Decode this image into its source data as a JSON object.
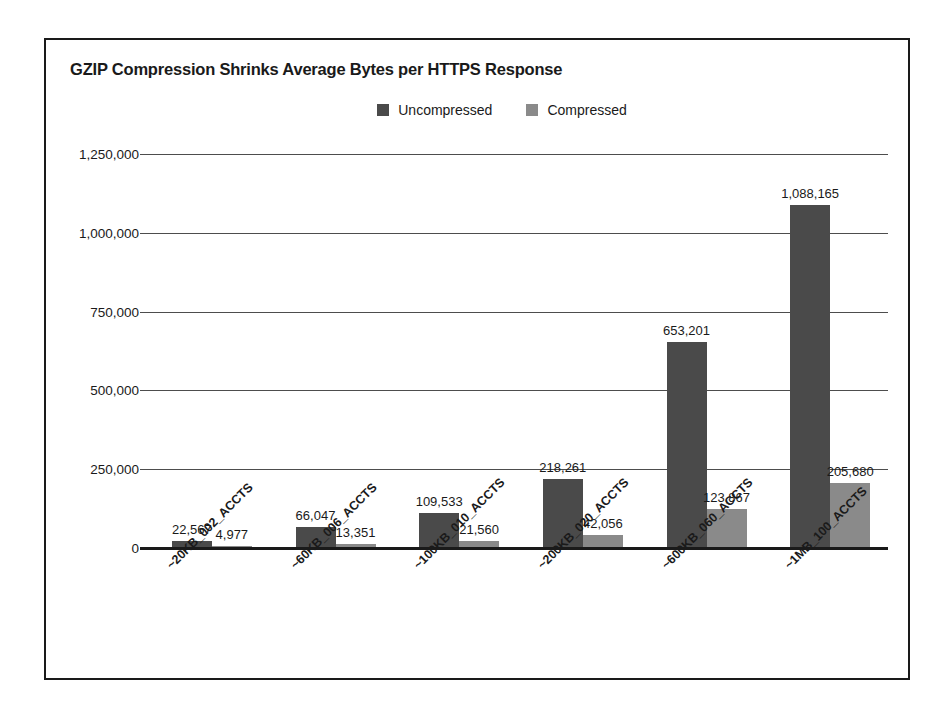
{
  "chart_data": {
    "type": "bar",
    "title": "GZIP Compression Shrinks Average Bytes per HTTPS Response",
    "xlabel": "",
    "ylabel": "",
    "ylim": [
      0,
      1250000
    ],
    "grid": true,
    "legend_position": "top-center",
    "categories": [
      "~20KB_002_ACCTS",
      "~60KB_006_ACCTS",
      "~100KB_010_ACCTS",
      "~200KB_020_ACCTS",
      "~600KB_060_ACCTS",
      "~1MB_100_ACCTS"
    ],
    "ytick_labels": [
      "0",
      "250,000",
      "500,000",
      "750,000",
      "1,000,000",
      "1,250,000"
    ],
    "ytick_values": [
      0,
      250000,
      500000,
      750000,
      1000000,
      1250000
    ],
    "series": [
      {
        "name": "Uncompressed",
        "color": "#4a4a4a",
        "values": [
          22567,
          66047,
          109533,
          218261,
          653201,
          1088165
        ],
        "labels": [
          "22,567",
          "66,047",
          "109,533",
          "218,261",
          "653,201",
          "1,088,165"
        ]
      },
      {
        "name": "Compressed",
        "color": "#8a8a8a",
        "values": [
          4977,
          13351,
          21560,
          42056,
          123867,
          205680
        ],
        "labels": [
          "4,977",
          "13,351",
          "21,560",
          "42,056",
          "123,867",
          "205,680"
        ]
      }
    ]
  }
}
